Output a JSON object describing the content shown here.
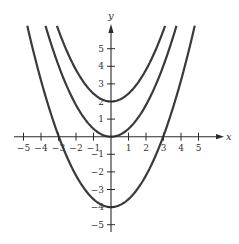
{
  "chart_data": {
    "type": "line",
    "title": "",
    "xlabel": "x",
    "ylabel": "y",
    "xlim": [
      -5.6,
      6
    ],
    "ylim": [
      -5.6,
      6.3
    ],
    "grid": false,
    "legend": "none",
    "x_ticks": [
      -5,
      -4,
      -3,
      -2,
      -1,
      1,
      2,
      3,
      4,
      5
    ],
    "x_tick_labels": [
      "−5",
      "−4",
      "−3",
      "−2",
      "−1",
      "1",
      "2",
      "3",
      "4",
      "5"
    ],
    "y_ticks": [
      -5,
      -4,
      -3,
      -2,
      -1,
      1,
      2,
      3,
      4,
      5
    ],
    "y_tick_labels": [
      "−5",
      "−4",
      "−3",
      "−2",
      "−1",
      "1",
      "2",
      "3",
      "4",
      "5"
    ],
    "series": [
      {
        "name": "upper parabola",
        "vertex": [
          0,
          2
        ],
        "coefficient": 0.45,
        "y_max": 6.3
      },
      {
        "name": "middle parabola",
        "vertex": [
          0,
          0
        ],
        "coefficient": 0.45,
        "y_max": 6.3
      },
      {
        "name": "lower parabola",
        "vertex": [
          0,
          -4
        ],
        "coefficient": 0.45,
        "y_max": 6.3
      }
    ]
  }
}
